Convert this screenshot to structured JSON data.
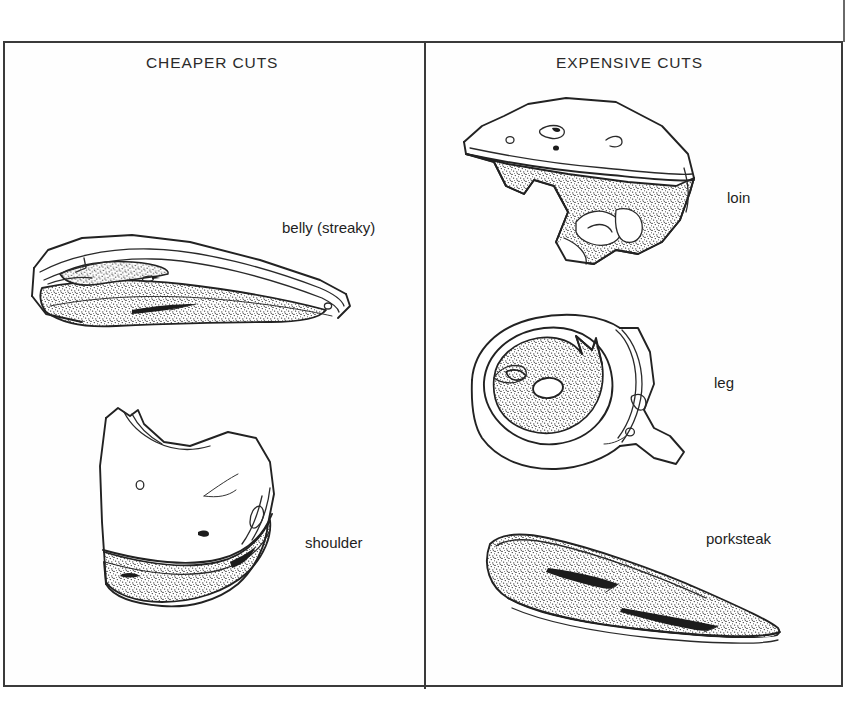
{
  "figure": {
    "type": "illustration-table",
    "columns": [
      {
        "id": "cheaper",
        "heading": "CHEAPER CUTS",
        "items": [
          {
            "id": "belly",
            "label": "belly (streaky)"
          },
          {
            "id": "shoulder",
            "label": "shoulder"
          }
        ]
      },
      {
        "id": "expensive",
        "heading": "EXPENSIVE CUTS",
        "items": [
          {
            "id": "loin",
            "label": "loin"
          },
          {
            "id": "leg",
            "label": "leg"
          },
          {
            "id": "porksteak",
            "label": "porksteak"
          }
        ]
      }
    ]
  },
  "icons": {
    "belly": "pork-belly-illustration",
    "shoulder": "pork-shoulder-illustration",
    "loin": "pork-loin-illustration",
    "leg": "pork-leg-illustration",
    "porksteak": "porksteak-illustration"
  },
  "colors": {
    "ink": "#222222",
    "frame": "#3a3a3a",
    "paper": "#ffffff",
    "text": "#1e1e1e"
  }
}
